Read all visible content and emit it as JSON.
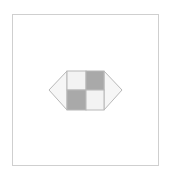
{
  "diagram": {
    "colors": {
      "frame_border": "#cfcfcf",
      "outline": "#b8b8b8",
      "light_cell": "#f3f3f3",
      "dark_cell": "#a9a9a9",
      "cap_fill": "#f6f6f6"
    },
    "cells": [
      {
        "position": "top-left",
        "shade": "light"
      },
      {
        "position": "top-right",
        "shade": "dark"
      },
      {
        "position": "bottom-left",
        "shade": "dark"
      },
      {
        "position": "bottom-right",
        "shade": "light"
      }
    ]
  }
}
